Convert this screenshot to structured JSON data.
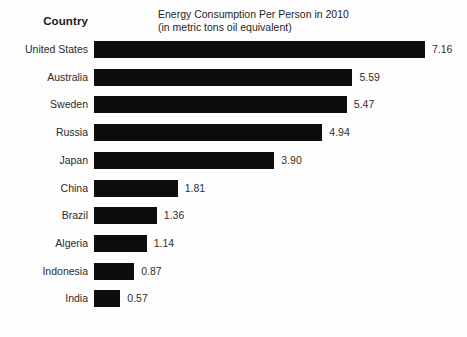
{
  "header": {
    "row_header_label": "Country",
    "title": "Energy Consumption Per Person in 2010",
    "subtitle": "(in metric tons oil equivalent)"
  },
  "style": {
    "bar_color": "#0d0d0d",
    "label_color": "#2b2b2b",
    "value_color": "#303030",
    "background": "#fdfdfd"
  },
  "chart_data": {
    "type": "bar",
    "orientation": "horizontal",
    "title": "Energy Consumption Per Person in 2010",
    "subtitle": "(in metric tons oil equivalent)",
    "xlabel": "",
    "ylabel": "Country",
    "grid": false,
    "legend": false,
    "xlim": [
      0,
      7.16
    ],
    "value_labels": true,
    "value_label_format": "0.00",
    "categories": [
      "United States",
      "Australia",
      "Sweden",
      "Russia",
      "Japan",
      "China",
      "Brazil",
      "Algeria",
      "Indonesia",
      "India"
    ],
    "values": [
      7.16,
      5.59,
      5.47,
      4.94,
      3.9,
      1.81,
      1.36,
      1.14,
      0.87,
      0.57
    ],
    "value_text": [
      "7.16",
      "5.59",
      "5.47",
      "4.94",
      "3.90",
      "1.81",
      "1.36",
      "1.14",
      "0.87",
      "0.57"
    ]
  }
}
